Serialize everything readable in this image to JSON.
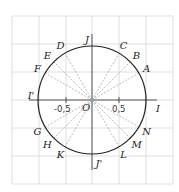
{
  "diagram": {
    "type": "unit-circle",
    "center_label": "O",
    "axis_ticks": [
      {
        "value": "-0,5",
        "x": -0.5
      },
      {
        "value": "0,5",
        "x": 0.5
      }
    ],
    "axis_points": [
      {
        "label": "I",
        "angle": 0
      },
      {
        "label": "J",
        "angle": 90
      },
      {
        "label": "I'",
        "angle": 180
      },
      {
        "label": "J'",
        "angle": 270
      }
    ],
    "circle_points": [
      {
        "label": "A",
        "angle": 30
      },
      {
        "label": "B",
        "angle": 45
      },
      {
        "label": "C",
        "angle": 60
      },
      {
        "label": "D",
        "angle": 120
      },
      {
        "label": "E",
        "angle": 135
      },
      {
        "label": "F",
        "angle": 150
      },
      {
        "label": "G",
        "angle": 210
      },
      {
        "label": "H",
        "angle": 225
      },
      {
        "label": "K",
        "angle": 240
      },
      {
        "label": "L",
        "angle": 300
      },
      {
        "label": "M",
        "angle": 315
      },
      {
        "label": "N",
        "angle": 330
      }
    ],
    "colors": {
      "grid": "#d6d6d6",
      "circle": "#222222",
      "axis": "#444444",
      "dashed": "#aaaaaa"
    }
  }
}
